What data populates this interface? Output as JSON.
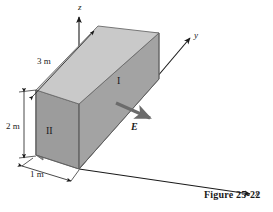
{
  "figure": {
    "caption": "Figure 25-22",
    "background_color": "#ffffff",
    "ink_color": "#1a1a1a"
  },
  "axes": {
    "z_label": "z",
    "y_label": "y",
    "x_label": "x",
    "origin_px": [
      79,
      169
    ]
  },
  "box": {
    "description": "rectangular slab",
    "faces": [
      {
        "name": "top-face",
        "shade": "#c9c9c9"
      },
      {
        "name": "front-right-face",
        "shade": "#a3a3a3"
      },
      {
        "name": "left-end-face",
        "shade": "#9a9a9a"
      }
    ],
    "edge_color": "#555555"
  },
  "dimensions": [
    {
      "name": "length",
      "label": "3 m"
    },
    {
      "name": "height",
      "label": "2 m"
    },
    {
      "name": "width",
      "label": "1 m"
    }
  ],
  "regions": [
    {
      "name": "region-one",
      "label": "I"
    },
    {
      "name": "region-two",
      "label": "II"
    }
  ],
  "field": {
    "label": "E",
    "vector_color": "#6b6b6b",
    "direction": "down-right along +x"
  }
}
